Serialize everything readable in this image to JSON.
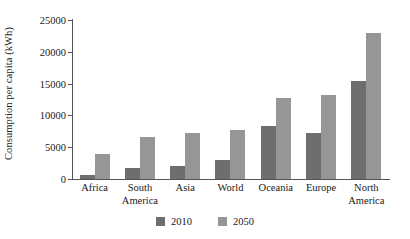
{
  "chart_data": {
    "type": "bar",
    "title": "",
    "xlabel": "",
    "ylabel": "Consumption per capita (kWh)",
    "ylim": [
      0,
      25000
    ],
    "yticks": [
      0,
      5000,
      10000,
      15000,
      20000,
      25000
    ],
    "ytick_labels": [
      "0",
      "5000",
      "10000",
      "15000",
      "20000",
      "25000"
    ],
    "grid": false,
    "legend_position": "bottom",
    "categories": [
      "Africa",
      "South America",
      "Asia",
      "World",
      "Oceania",
      "Europe",
      "North America"
    ],
    "category_lines": [
      [
        "Africa"
      ],
      [
        "South",
        "America"
      ],
      [
        "Asia"
      ],
      [
        "World"
      ],
      [
        "Oceania"
      ],
      [
        "Europe"
      ],
      [
        "North",
        "America"
      ]
    ],
    "series": [
      {
        "name": "2010",
        "color": "#6e6e6e",
        "values": [
          600,
          1800,
          2050,
          3050,
          8350,
          7200,
          15450
        ]
      },
      {
        "name": "2050",
        "color": "#969696",
        "values": [
          3900,
          6600,
          7300,
          7650,
          12800,
          13250,
          22900
        ]
      }
    ]
  },
  "legend": {
    "entries": [
      {
        "label": "2010",
        "color": "#6e6e6e"
      },
      {
        "label": "2050",
        "color": "#969696"
      }
    ]
  },
  "axes": {
    "y_title": "Consumption per capita (kWh)"
  }
}
